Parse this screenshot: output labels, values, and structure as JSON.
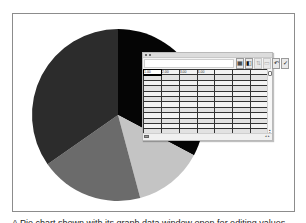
{
  "figure": {
    "caption": "A Pie chart shown with its graph data window open for editing values"
  },
  "pie_chart": {
    "center": [
      118,
      115
    ],
    "radius": 86,
    "slices": [
      {
        "name": "slice-black",
        "color": "#050505",
        "start_deg": 0,
        "end_deg": 118
      },
      {
        "name": "slice-light-gray",
        "color": "#c4c4c4",
        "start_deg": 118,
        "end_deg": 165
      },
      {
        "name": "slice-medium-gray",
        "color": "#6b6b6b",
        "start_deg": 165,
        "end_deg": 235
      },
      {
        "name": "slice-dark-gray",
        "color": "#2c2c2c",
        "start_deg": 235,
        "end_deg": 360
      }
    ]
  },
  "graph_data_window": {
    "entry_value": "",
    "toolbar": [
      {
        "name": "import-data-icon",
        "glyph": "▦",
        "enabled": true
      },
      {
        "name": "transpose-row-column-icon",
        "glyph": "◧",
        "enabled": true
      },
      {
        "name": "switch-xy-icon",
        "glyph": "⇅",
        "enabled": false
      },
      {
        "name": "cell-style-icon",
        "glyph": "▭",
        "enabled": false
      },
      {
        "name": "revert-icon",
        "glyph": "↶",
        "enabled": true
      },
      {
        "name": "apply-icon",
        "glyph": "✓",
        "enabled": true
      }
    ],
    "rows": [
      [
        "1.00",
        "2.00",
        "3.00",
        "4.00",
        "",
        "",
        ""
      ],
      [
        "",
        "",
        "",
        "",
        "",
        "",
        ""
      ],
      [
        "",
        "",
        "",
        "",
        "",
        "",
        ""
      ],
      [
        "",
        "",
        "",
        "",
        "",
        "",
        ""
      ],
      [
        "",
        "",
        "",
        "",
        "",
        "",
        ""
      ],
      [
        "",
        "",
        "",
        "",
        "",
        "",
        ""
      ],
      [
        "",
        "",
        "",
        "",
        "",
        "",
        ""
      ],
      [
        "",
        "",
        "",
        "",
        "",
        "",
        ""
      ],
      [
        "",
        "",
        "",
        "",
        "",
        "",
        ""
      ],
      [
        "",
        "",
        "",
        "",
        "",
        "",
        ""
      ],
      [
        "",
        "",
        "",
        "",
        "",
        "",
        ""
      ],
      [
        "",
        "",
        "",
        "",
        "",
        "",
        ""
      ]
    ]
  }
}
